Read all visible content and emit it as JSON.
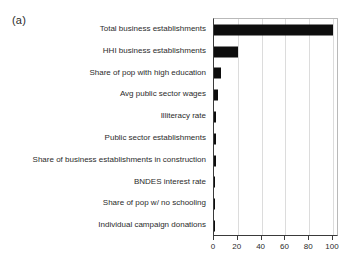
{
  "figure": {
    "panel_label": "(a)",
    "background_color": "#ffffff",
    "bar_color": "#0d0d0d",
    "grid_color": "#dcdcdc",
    "axis_color": "#3a3a3a"
  },
  "chart_data": {
    "type": "bar",
    "orientation": "horizontal",
    "title": "",
    "xlabel": "",
    "ylabel": "",
    "xlim": [
      0,
      105
    ],
    "xticks": [
      0,
      20,
      40,
      60,
      80,
      100
    ],
    "xtick_labels": [
      "0",
      "20",
      "40",
      "60",
      "80",
      "100"
    ],
    "grid": true,
    "grid_axis": "x",
    "legend": false,
    "categories": [
      "Total business establishments",
      "HHI business establishments",
      "Share of pop with high education",
      "Avg public sector wages",
      "Illiteracy rate",
      "Public sector establishments",
      "Share of business establishments in construction",
      "BNDES interest rate",
      "Share of pop w/ no schooling",
      "Individual campaign donations"
    ],
    "values": [
      100,
      20,
      6,
      3.5,
      2,
      2,
      1.5,
      1,
      0.3,
      0.1
    ]
  }
}
